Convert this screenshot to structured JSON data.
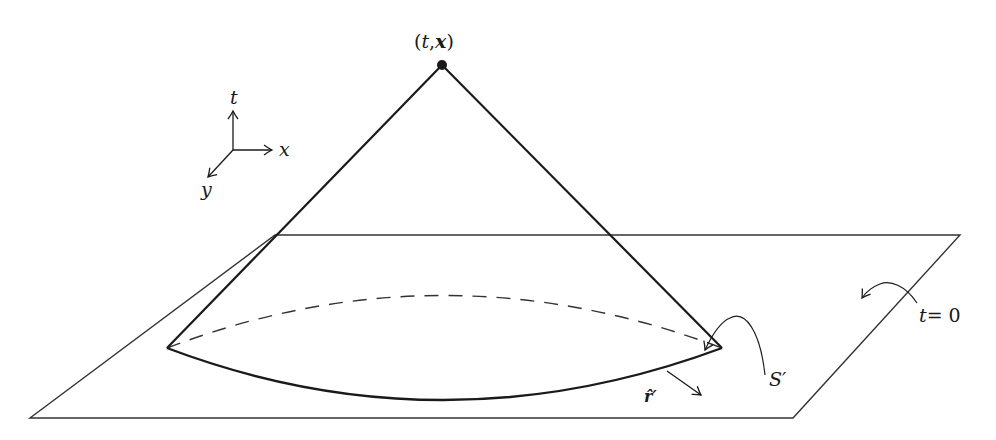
{
  "figure": {
    "colors": {
      "ink": "#1a1a1a",
      "plane": "#333333",
      "background": "#ffffff"
    },
    "apex_label": {
      "open": "(",
      "t": "t",
      "comma": ",",
      "x": "x",
      "close": ")"
    },
    "axes": {
      "t": "t",
      "x": "x",
      "y": "y"
    },
    "plane_label": {
      "t": "t",
      "eq": "= 0"
    },
    "surface_label": "S′",
    "normal_label": "r̂′"
  }
}
